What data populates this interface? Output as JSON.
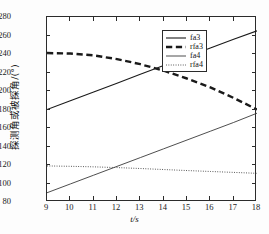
{
  "chart_data": {
    "type": "line",
    "title": "",
    "xlabel": "t/s",
    "ylabel": "探测角或被探角/(°)",
    "xlim": [
      9,
      18
    ],
    "ylim": [
      80,
      280
    ],
    "xticks": [
      9,
      10,
      11,
      12,
      13,
      14,
      15,
      16,
      17,
      18
    ],
    "yticks": [
      80,
      100,
      120,
      140,
      160,
      180,
      200,
      220,
      240,
      260,
      280
    ],
    "grid": false,
    "legend_position": "upper right",
    "x": [
      9,
      10,
      11,
      12,
      13,
      14,
      15,
      16,
      17,
      18
    ],
    "series": [
      {
        "name": "fa3",
        "style": "solid",
        "width": 1.1,
        "color": "#1a1a1a",
        "values": [
          180,
          189.5,
          199,
          208.5,
          218,
          227.5,
          237,
          246.5,
          256,
          265
        ]
      },
      {
        "name": "rfa3",
        "style": "dashed",
        "width": 2.4,
        "color": "#1a1a1a",
        "values": [
          241,
          240.5,
          238.5,
          234.5,
          229,
          222,
          213.5,
          204,
          192.5,
          180
        ]
      },
      {
        "name": "fa4",
        "style": "solid",
        "width": 0.9,
        "color": "#3a3a3a",
        "values": [
          90,
          99.5,
          109,
          118.5,
          128,
          137.5,
          147,
          156.5,
          166,
          176
        ]
      },
      {
        "name": "rfa4",
        "style": "dotted",
        "width": 1.0,
        "color": "#4a4a4a",
        "values": [
          119,
          118.6,
          118,
          117.2,
          116.2,
          115.1,
          114.0,
          113.0,
          112.0,
          111
        ]
      }
    ],
    "annotations": [
      {
        "text": "fa3 crosses rfa3",
        "x": 13,
        "y": 218
      },
      {
        "text": "fa4 crosses rfa4",
        "x": 11.95,
        "y": 117.5
      }
    ]
  },
  "legend": {
    "items": [
      {
        "label": "fa3"
      },
      {
        "label": "rfa3"
      },
      {
        "label": "fa4"
      },
      {
        "label": "rfa4"
      }
    ]
  }
}
